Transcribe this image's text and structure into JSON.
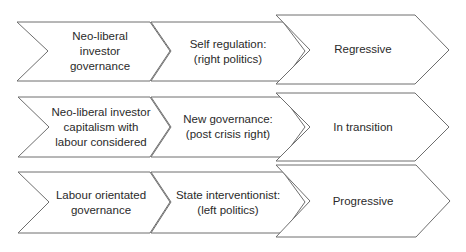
{
  "diagram": {
    "rows": [
      {
        "name": "row-regressive",
        "governance": "Neo-liberal\ninvestor\ngovernance",
        "politics": "Self regulation:\n(right politics)",
        "outcome": "Regressive"
      },
      {
        "name": "row-in-transition",
        "governance": "Neo-liberal investor\ncapitalism with\nlabour considered",
        "politics": "New governance:\n(post crisis right)",
        "outcome": "In transition"
      },
      {
        "name": "row-progressive",
        "governance": "Labour orientated\ngovernance",
        "politics": "State interventionist:\n(left politics)",
        "outcome": "Progressive"
      }
    ],
    "colors": {
      "stroke": "#6e6e6e",
      "fill": "#ffffff",
      "text": "#2a2a2a"
    }
  }
}
